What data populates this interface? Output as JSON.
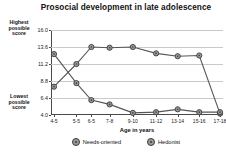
{
  "chart_data": {
    "type": "line",
    "title": "Prosocial development in late adolescence",
    "xlabel": "Age in years",
    "ylabel": "",
    "grid": true,
    "legend_position": "bottom",
    "ylim": [
      4.0,
      16.0
    ],
    "yticks": [
      "4.0",
      "6.4",
      "8.8",
      "11.2",
      "13.6",
      "16.0"
    ],
    "ytick_values": [
      4.0,
      6.4,
      8.8,
      11.2,
      13.6,
      16.0
    ],
    "categories": [
      "4-5",
      "5-5",
      "6-5",
      "7-8",
      "9-10",
      "11-12",
      "13-14",
      "15-16",
      "17-18"
    ],
    "series": [
      {
        "name": "Needs-oriented",
        "values": [
          8.0,
          11.2,
          13.6,
          13.5,
          13.6,
          12.7,
          12.3,
          12.4,
          4.2
        ]
      },
      {
        "name": "Hedonist",
        "values": [
          12.6,
          8.5,
          6.1,
          5.5,
          4.3,
          4.4,
          4.8,
          4.4,
          4.4
        ]
      }
    ],
    "annotations": {
      "y_axis_top_note": "Highest possible score",
      "y_axis_bottom_note": "Lowest possible score"
    }
  },
  "axis_notes": {
    "highest": "Highest\npossible\nscore",
    "highest_line1": "Highest",
    "highest_line2": "possible",
    "highest_line3": "score",
    "lowest_line1": "Lowest",
    "lowest_line2": "possible",
    "lowest_line3": "score"
  },
  "colors": {
    "marker_fill": "#9a9a9a",
    "marker_stroke": "#3b3b3b",
    "line": "#555555",
    "grid": "#c9c9c9",
    "axis": "#4a4a4a",
    "text": "#111111",
    "background": "#ffffff"
  }
}
